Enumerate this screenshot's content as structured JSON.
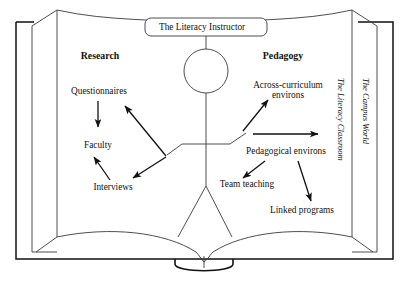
{
  "figure": {
    "type": "concentric-context-diagram",
    "metaphor": "open-book",
    "stroke_color": "#3a3a3a",
    "heavy_stroke_color": "#111111",
    "background_color": "#ffffff",
    "arrow_color": "#111111"
  },
  "central": {
    "title_box": "The Literacy Instructor",
    "figure_name": "stick-figure-instructor"
  },
  "columns": {
    "left_heading": "Research",
    "right_heading": "Pedagogy"
  },
  "research_nodes": [
    {
      "label": "Questionnaires"
    },
    {
      "label": "Faculty"
    },
    {
      "label": "Interviews"
    }
  ],
  "pedagogy_nodes": [
    {
      "label": "Across-curriculum environs"
    },
    {
      "label": "Pedagogical environs"
    },
    {
      "label": "Team teaching"
    },
    {
      "label": "Linked programs"
    }
  ],
  "context_rings": [
    {
      "label": "The Literacy Classroom"
    },
    {
      "label": "The Campus World"
    }
  ],
  "arrows": [
    {
      "from": "Questionnaires",
      "to": "Faculty"
    },
    {
      "from": "instructor-left-arm",
      "to": "Questionnaires"
    },
    {
      "from": "instructor-left-arm",
      "to": "Interviews"
    },
    {
      "from": "Interviews",
      "to": "Faculty"
    },
    {
      "from": "instructor-right-arm",
      "to": "Across-curriculum environs"
    },
    {
      "from": "instructor-right-arm",
      "to": "The Literacy Classroom"
    },
    {
      "from": "Pedagogical environs",
      "to": "Team teaching"
    },
    {
      "from": "Pedagogical environs",
      "to": "Linked programs"
    }
  ]
}
